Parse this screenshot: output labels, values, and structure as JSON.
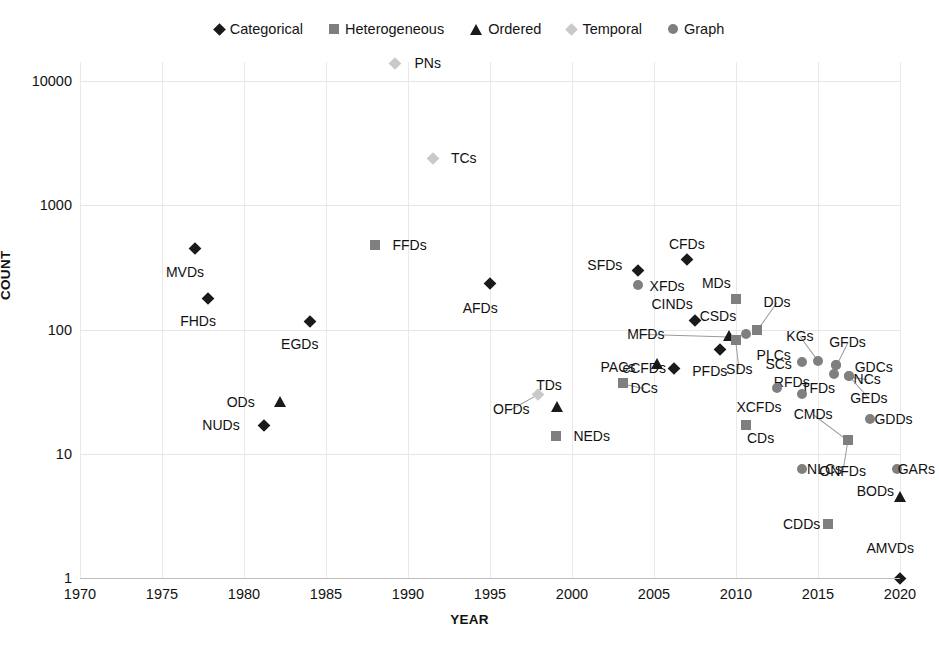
{
  "chart_data": {
    "type": "scatter",
    "title": "",
    "xlabel": "YEAR",
    "ylabel": "COUNT",
    "xlim": [
      1970,
      2021
    ],
    "ylim": [
      1,
      20000
    ],
    "yscale": "log",
    "xticks": [
      "1970",
      "1975",
      "1980",
      "1985",
      "1990",
      "1995",
      "2000",
      "2005",
      "2010",
      "2015",
      "2020"
    ],
    "yticks": [
      "1",
      "10",
      "100",
      "1000",
      "10000"
    ],
    "grid": true,
    "legend_position": "top-center",
    "series": [
      {
        "name": "Categorical",
        "marker": "diamond",
        "color": "#1a1a1a"
      },
      {
        "name": "Heterogeneous",
        "marker": "square",
        "color": "#7f7f7f"
      },
      {
        "name": "Ordered",
        "marker": "triangle",
        "color": "#1a1a1a"
      },
      {
        "name": "Temporal",
        "marker": "diamond",
        "color": "#c9c9c9"
      },
      {
        "name": "Graph",
        "marker": "circle",
        "color": "#7f7f7f"
      }
    ],
    "points": [
      {
        "label": "MVDs",
        "x": 1977.0,
        "y": 450,
        "series": "Categorical",
        "lx": 1976.4,
        "ly": 290,
        "leader": false
      },
      {
        "label": "FHDs",
        "x": 1977.8,
        "y": 180,
        "series": "Categorical",
        "lx": 1977.2,
        "ly": 117,
        "leader": false
      },
      {
        "label": "EGDs",
        "x": 1984.0,
        "y": 118,
        "series": "Categorical",
        "lx": 1983.4,
        "ly": 77,
        "leader": false
      },
      {
        "label": "ODs",
        "x": 1982.2,
        "y": 26,
        "series": "Ordered",
        "lx": 1979.8,
        "ly": 26,
        "leader": false
      },
      {
        "label": "NUDs",
        "x": 1981.2,
        "y": 17,
        "series": "Categorical",
        "lx": 1978.6,
        "ly": 17,
        "leader": false
      },
      {
        "label": "FFDs",
        "x": 1988.0,
        "y": 480,
        "series": "Heterogeneous",
        "lx": 1990.1,
        "ly": 480,
        "leader": false
      },
      {
        "label": "PNs",
        "x": 1989.2,
        "y": 14000,
        "series": "Temporal",
        "lx": 1991.2,
        "ly": 14000,
        "leader": false
      },
      {
        "label": "TCs",
        "x": 1991.5,
        "y": 2400,
        "series": "Temporal",
        "lx": 1993.4,
        "ly": 2400,
        "leader": false
      },
      {
        "label": "AFDs",
        "x": 1995.0,
        "y": 235,
        "series": "Categorical",
        "lx": 1994.4,
        "ly": 150,
        "leader": false
      },
      {
        "label": "OFDs",
        "x": 1997.9,
        "y": 30,
        "series": "Temporal",
        "lx": 1996.3,
        "ly": 23,
        "leader": true
      },
      {
        "label": "TDs",
        "x": 1999.1,
        "y": 24,
        "series": "Ordered",
        "lx": 1998.6,
        "ly": 36,
        "leader": false
      },
      {
        "label": "NEDs",
        "x": 1999.0,
        "y": 14,
        "series": "Heterogeneous",
        "lx": 2001.2,
        "ly": 14,
        "leader": false
      },
      {
        "label": "DCs",
        "x": 2003.1,
        "y": 37,
        "series": "Heterogeneous",
        "lx": 2004.4,
        "ly": 34,
        "leader": true
      },
      {
        "label": "PACs",
        "x": 2005.2,
        "y": 53,
        "series": "Ordered",
        "lx": 2002.8,
        "ly": 50,
        "leader": false
      },
      {
        "label": "SFDs",
        "x": 2004.0,
        "y": 300,
        "series": "Categorical",
        "lx": 2002.0,
        "ly": 330,
        "leader": false
      },
      {
        "label": "XFDs",
        "x": 2004.0,
        "y": 230,
        "series": "Graph",
        "lx": 2005.8,
        "ly": 222,
        "leader": false
      },
      {
        "label": "CFDs",
        "x": 2007.0,
        "y": 370,
        "series": "Categorical",
        "lx": 2007.0,
        "ly": 490,
        "leader": false
      },
      {
        "label": "CINDs",
        "x": 2007.5,
        "y": 120,
        "series": "Categorical",
        "lx": 2006.1,
        "ly": 160,
        "leader": false
      },
      {
        "label": "MDs",
        "x": 2010.0,
        "y": 175,
        "series": "Heterogeneous",
        "lx": 2008.8,
        "ly": 235,
        "leader": false
      },
      {
        "label": "eCFDs",
        "x": 2006.2,
        "y": 49,
        "series": "Categorical",
        "lx": 2004.4,
        "ly": 49,
        "leader": false
      },
      {
        "label": "PFDs",
        "x": 2009.0,
        "y": 70,
        "series": "Categorical",
        "lx": 2008.4,
        "ly": 46,
        "leader": false
      },
      {
        "label": "MFDs",
        "x": 2009.6,
        "y": 88,
        "series": "Ordered",
        "lx": 2004.5,
        "ly": 92,
        "leader": true
      },
      {
        "label": "SDs",
        "x": 2010.0,
        "y": 82,
        "series": "Heterogeneous",
        "lx": 2010.2,
        "ly": 48,
        "leader": true
      },
      {
        "label": "CSDs",
        "x": 2010.6,
        "y": 92,
        "series": "Graph",
        "lx": 2008.9,
        "ly": 128,
        "leader": false
      },
      {
        "label": "PLCs",
        "x": 2011.3,
        "y": 100,
        "series": "Heterogeneous",
        "lx": 2012.3,
        "ly": 62,
        "leader": false
      },
      {
        "label": "DDs",
        "x": 2011.3,
        "y": 100,
        "series": "Heterogeneous",
        "lx": 2012.5,
        "ly": 168,
        "leader": true
      },
      {
        "label": "SCs",
        "x": 2014.0,
        "y": 55,
        "series": "Graph",
        "lx": 2012.6,
        "ly": 53,
        "leader": false
      },
      {
        "label": "KGs",
        "x": 2015.0,
        "y": 56,
        "series": "Graph",
        "lx": 2013.9,
        "ly": 88,
        "leader": true
      },
      {
        "label": "GFDs",
        "x": 2016.1,
        "y": 52,
        "series": "Graph",
        "lx": 2016.8,
        "ly": 80,
        "leader": true
      },
      {
        "label": "GDCs",
        "x": 2016.1,
        "y": 52,
        "series": "Graph",
        "lx": 2018.4,
        "ly": 50,
        "leader": false
      },
      {
        "label": "TFDs",
        "x": 2016.0,
        "y": 44,
        "series": "Graph",
        "lx": 2015.0,
        "ly": 34,
        "leader": false
      },
      {
        "label": "NCs",
        "x": 2016.9,
        "y": 42,
        "series": "Graph",
        "lx": 2018.0,
        "ly": 40,
        "leader": true
      },
      {
        "label": "GEDs",
        "x": 2016.9,
        "y": 42,
        "series": "Graph",
        "lx": 2018.1,
        "ly": 28,
        "leader": true
      },
      {
        "label": "RFDs",
        "x": 2014.0,
        "y": 30,
        "series": "Graph",
        "lx": 2013.4,
        "ly": 38,
        "leader": false
      },
      {
        "label": "XCFDs",
        "x": 2012.5,
        "y": 34,
        "series": "Graph",
        "lx": 2011.4,
        "ly": 24,
        "leader": false
      },
      {
        "label": "CDs",
        "x": 2010.6,
        "y": 17,
        "series": "Heterogeneous",
        "lx": 2011.5,
        "ly": 13.4,
        "leader": false
      },
      {
        "label": "GDDs",
        "x": 2018.2,
        "y": 19,
        "series": "Graph",
        "lx": 2019.6,
        "ly": 19,
        "leader": false
      },
      {
        "label": "CMDs",
        "x": 2016.8,
        "y": 13,
        "series": "Heterogeneous",
        "lx": 2014.7,
        "ly": 21,
        "leader": true
      },
      {
        "label": "ONFDs",
        "x": 2016.8,
        "y": 13,
        "series": "Heterogeneous",
        "lx": 2016.5,
        "ly": 7.3,
        "leader": true
      },
      {
        "label": "NLCs",
        "x": 2014.0,
        "y": 7.5,
        "series": "Graph",
        "lx": 2015.4,
        "ly": 7.5,
        "leader": false
      },
      {
        "label": "GARs",
        "x": 2019.8,
        "y": 7.5,
        "series": "Graph",
        "lx": 2021.0,
        "ly": 7.5,
        "leader": false
      },
      {
        "label": "BODs",
        "x": 2020.0,
        "y": 4.5,
        "series": "Ordered",
        "lx": 2018.5,
        "ly": 5.0,
        "leader": false
      },
      {
        "label": "CDDs",
        "x": 2015.6,
        "y": 2.7,
        "series": "Heterogeneous",
        "lx": 2014.0,
        "ly": 2.7,
        "leader": false
      },
      {
        "label": "AMVDs",
        "x": 2020.0,
        "y": 1.0,
        "series": "Categorical",
        "lx": 2019.4,
        "ly": 1.75,
        "leader": false
      }
    ]
  }
}
